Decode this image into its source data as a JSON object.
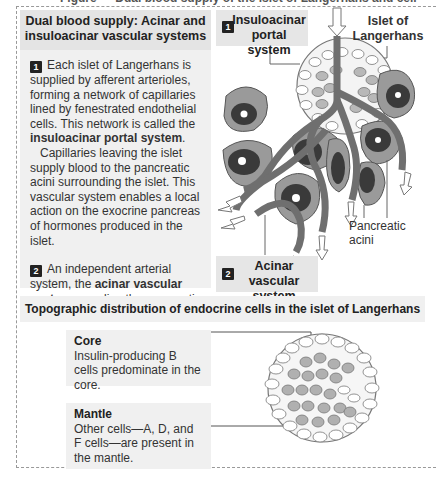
{
  "figure": {
    "clipped_title": "Figure — Dual blood supply of the islet of Langerhans and cell distribution"
  },
  "left_panel": {
    "heading_line1": "Dual blood supply: Acinar and",
    "heading_line2": "insuloacinar vascular systems",
    "para1": {
      "number": "1",
      "text_before": "Each islet of Langerhans is supplied by afferent arterioles, forming a network of capillaries lined by fenestrated endothelial cells. This network is called the ",
      "bold": "insuloacinar portal system",
      "text_after": "."
    },
    "para2": "Capillaries leaving the islet supply blood to the pancreatic acini surrounding the islet.  This vascular system enables a local action on the exocrine pancreas of hormones produced in the islet.",
    "para3": {
      "number": "2",
      "text_before": "An independent arterial system, the ",
      "bold": "acinar vascular system",
      "text_after": ", supplies the pancreatic acini."
    }
  },
  "diagram_top": {
    "label_insuloacinar": {
      "number": "1",
      "line1": "Insuloacinar",
      "line2": "portal system"
    },
    "label_islet": {
      "line1": "Islet of",
      "line2": "Langerhans"
    },
    "label_acini": "Pancreatic acini",
    "label_acinar": {
      "number": "2",
      "line1": "Acinar vascular",
      "line2": "system"
    }
  },
  "bottom_section": {
    "heading": "Topographic distribution of endocrine cells in the islet of Langerhans",
    "core": {
      "title": "Core",
      "text": "Insulin-producing B cells predominate in the core."
    },
    "mantle": {
      "title": "Mantle",
      "text": "Other cells—A, D, and F cells—are present in the mantle."
    }
  },
  "colors": {
    "panel_bg": "#f0f0f0",
    "heading_bg": "#e4e4e4",
    "vessel": "#6f6f6f",
    "acinus_outer": "#9a9a9a",
    "acinus_inner": "#3a3a3a",
    "b_cell": "#b0b0b0"
  }
}
